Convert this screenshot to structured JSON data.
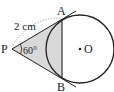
{
  "diagram": {
    "points": {
      "P": {
        "label": "P",
        "x": 12,
        "y": 49
      },
      "A": {
        "label": "A",
        "x": 62,
        "y": 19
      },
      "B": {
        "label": "B",
        "x": 62,
        "y": 78
      },
      "O": {
        "label": "O",
        "x": 80,
        "y": 49
      }
    },
    "circle": {
      "cx": 80,
      "cy": 49,
      "r": 34
    },
    "labels": {
      "length": "2 cm",
      "angle": "60°",
      "P": "P",
      "A": "A",
      "B": "B",
      "O": "•O"
    },
    "colors": {
      "stroke": "#222222",
      "shade": "#d9d9d9",
      "dotted": "#888888"
    }
  }
}
